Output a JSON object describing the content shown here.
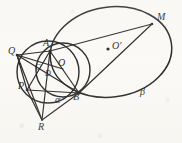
{
  "figure": {
    "kind": "euclidean-geometry-diagram",
    "stroke_color": "#151515",
    "background_color": "#fbfaf7",
    "width": 182,
    "height": 143,
    "points": [
      {
        "id": "Q",
        "label": "Q",
        "x": 17,
        "y": 55,
        "label_x": 8,
        "label_y": 47
      },
      {
        "id": "A",
        "label": "A",
        "x": 50,
        "y": 51,
        "label_x": 43,
        "label_y": 38
      },
      {
        "id": "O",
        "label": "O",
        "x": 63,
        "y": 69,
        "label_x": 58,
        "label_y": 59
      },
      {
        "id": "C",
        "label": "C",
        "x": 41,
        "y": 73,
        "label_x": 35,
        "label_y": 65
      },
      {
        "id": "D",
        "label": "D",
        "x": 50,
        "y": 79,
        "label_x": 45,
        "label_y": 70
      },
      {
        "id": "P",
        "label": "P",
        "x": 27,
        "y": 90,
        "label_x": 18,
        "label_y": 81
      },
      {
        "id": "B",
        "label": "B",
        "x": 79,
        "y": 93,
        "label_x": 74,
        "label_y": 93
      },
      {
        "id": "R",
        "label": "R",
        "x": 42,
        "y": 120,
        "label_x": 38,
        "label_y": 122
      },
      {
        "id": "M",
        "label": "M",
        "x": 152,
        "y": 24,
        "label_x": 156,
        "label_y": 12
      },
      {
        "id": "Oprime",
        "label": "O′",
        "x": 111,
        "y": 49,
        "label_x": 113,
        "label_y": 41
      }
    ],
    "curve_labels": [
      {
        "id": "beta",
        "label": "β",
        "x": 141,
        "y": 88
      },
      {
        "id": "alpha",
        "label": "α",
        "x": 55,
        "y": 96
      }
    ],
    "markers": [
      {
        "id": "center-dot-o-prime",
        "x": 108,
        "y": 49,
        "r": 1.6
      }
    ],
    "curves": {
      "large_ellipse": {
        "cx": 111,
        "cy": 52,
        "rx": 61,
        "ry": 45,
        "rotation": -8
      },
      "mid_circle": {
        "cx": 63,
        "cy": 70,
        "r": 27
      },
      "left_circle": {
        "cx": 48,
        "cy": 72,
        "r": 31
      }
    },
    "segments": [
      {
        "from": "Q",
        "to": "A"
      },
      {
        "from": "Q",
        "to": "O"
      },
      {
        "from": "Q",
        "to": "B"
      },
      {
        "from": "Q",
        "to": "P"
      },
      {
        "from": "A",
        "to": "M"
      },
      {
        "from": "A",
        "to": "B"
      },
      {
        "from": "A",
        "to": "P"
      },
      {
        "from": "A",
        "to": "R"
      },
      {
        "from": "P",
        "to": "B"
      },
      {
        "from": "P",
        "to": "R"
      },
      {
        "from": "B",
        "to": "R"
      },
      {
        "from": "B",
        "to": "M"
      },
      {
        "from": "Q",
        "to": "R"
      }
    ]
  }
}
